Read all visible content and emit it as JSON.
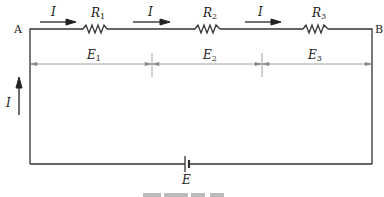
{
  "diagram": {
    "type": "series-circuit",
    "nodes": {
      "left": "A",
      "right": "B"
    },
    "current_label": "I",
    "resistors": [
      {
        "name": "R",
        "sub": "1"
      },
      {
        "name": "R",
        "sub": "2"
      },
      {
        "name": "R",
        "sub": "3"
      }
    ],
    "voltage_drops": [
      {
        "name": "E",
        "sub": "1"
      },
      {
        "name": "E",
        "sub": "2"
      },
      {
        "name": "E",
        "sub": "3"
      }
    ],
    "source": {
      "name": "E"
    },
    "colors": {
      "wire": "#333333",
      "dimension": "#888888"
    }
  }
}
